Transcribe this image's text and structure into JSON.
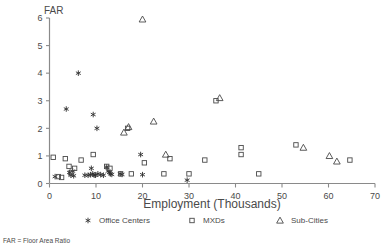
{
  "chart_data": {
    "type": "scatter",
    "title": "",
    "xlabel": "Employment (Thousands)",
    "ylabel": "FAR",
    "xlim": [
      0,
      70
    ],
    "ylim": [
      0,
      6
    ],
    "xticks": [
      0,
      10,
      20,
      30,
      40,
      50,
      60,
      70
    ],
    "yticks": [
      0,
      1,
      2,
      3,
      4,
      5,
      6
    ],
    "grid": false,
    "legend_position": "below-axis",
    "footnote": "FAR = Floor Area Ratio",
    "series": [
      {
        "name": "Office Centers",
        "marker": "asterisk",
        "points": [
          [
            1.2,
            0.25
          ],
          [
            3.6,
            2.7
          ],
          [
            4.3,
            0.4
          ],
          [
            4.6,
            0.3
          ],
          [
            5.0,
            0.45
          ],
          [
            5.2,
            0.28
          ],
          [
            6.2,
            4.0
          ],
          [
            7.6,
            0.3
          ],
          [
            8.3,
            0.3
          ],
          [
            8.8,
            0.32
          ],
          [
            9.0,
            0.55
          ],
          [
            9.3,
            0.35
          ],
          [
            9.4,
            2.5
          ],
          [
            9.6,
            0.3
          ],
          [
            9.9,
            0.3
          ],
          [
            10.2,
            2.0
          ],
          [
            10.4,
            0.35
          ],
          [
            11.0,
            0.32
          ],
          [
            11.6,
            0.3
          ],
          [
            12.3,
            0.6
          ],
          [
            12.6,
            0.45
          ],
          [
            12.9,
            0.4
          ],
          [
            13.1,
            0.35
          ],
          [
            13.4,
            0.33
          ],
          [
            15.2,
            0.35
          ],
          [
            15.6,
            0.33
          ],
          [
            19.6,
            1.05
          ],
          [
            20.0,
            0.32
          ],
          [
            29.6,
            0.12
          ]
        ]
      },
      {
        "name": "MXDs",
        "marker": "square",
        "points": [
          [
            0.8,
            0.95
          ],
          [
            1.9,
            0.25
          ],
          [
            2.6,
            0.22
          ],
          [
            3.4,
            0.9
          ],
          [
            4.2,
            0.62
          ],
          [
            4.6,
            0.38
          ],
          [
            5.4,
            0.55
          ],
          [
            6.8,
            0.85
          ],
          [
            9.4,
            1.05
          ],
          [
            12.3,
            0.62
          ],
          [
            13.0,
            0.55
          ],
          [
            15.3,
            0.35
          ],
          [
            16.8,
            2.0
          ],
          [
            17.6,
            0.35
          ],
          [
            20.4,
            0.75
          ],
          [
            24.6,
            0.35
          ],
          [
            25.9,
            0.9
          ],
          [
            30.0,
            0.35
          ],
          [
            33.4,
            0.85
          ],
          [
            35.8,
            3.0
          ],
          [
            41.2,
            1.3
          ],
          [
            41.2,
            1.05
          ],
          [
            45.0,
            0.35
          ],
          [
            53.0,
            1.4
          ],
          [
            64.6,
            0.85
          ]
        ]
      },
      {
        "name": "Sub-Cities",
        "marker": "triangle",
        "points": [
          [
            20.0,
            5.95
          ],
          [
            16.0,
            1.85
          ],
          [
            17.0,
            2.05
          ],
          [
            22.4,
            2.25
          ],
          [
            25.0,
            1.05
          ],
          [
            36.6,
            3.1
          ],
          [
            54.6,
            1.3
          ],
          [
            60.2,
            1.0
          ],
          [
            61.8,
            0.8
          ]
        ]
      }
    ]
  },
  "legend": {
    "items": [
      {
        "marker": "asterisk",
        "label": "Office Centers"
      },
      {
        "marker": "square",
        "label": "MXDs"
      },
      {
        "marker": "triangle",
        "label": "Sub-Cities"
      }
    ]
  },
  "colors": {
    "axis": "#8a8a8a",
    "marker": "#4a4a4a",
    "text": "#4a4a4a",
    "background": "#ffffff"
  }
}
